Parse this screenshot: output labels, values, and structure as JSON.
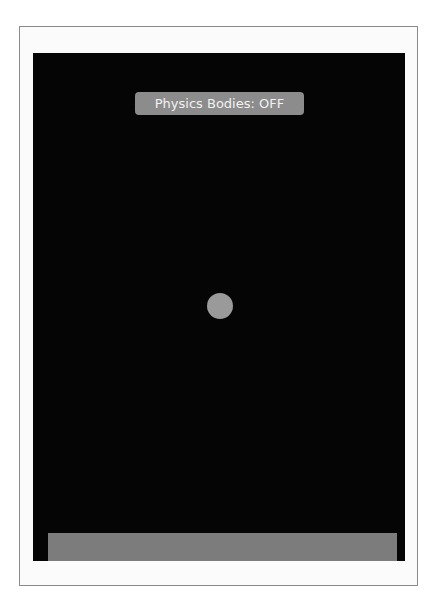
{
  "scene": {
    "background_color": "#050505",
    "debug_label": {
      "text": "Physics Bodies: OFF",
      "background_color": "#8c8c8c",
      "text_color": "#f2f2f2"
    },
    "ball": {
      "shape": "circle",
      "color": "#9a9a9a"
    },
    "ground": {
      "shape": "rectangle",
      "color": "#7c7c7c"
    }
  }
}
